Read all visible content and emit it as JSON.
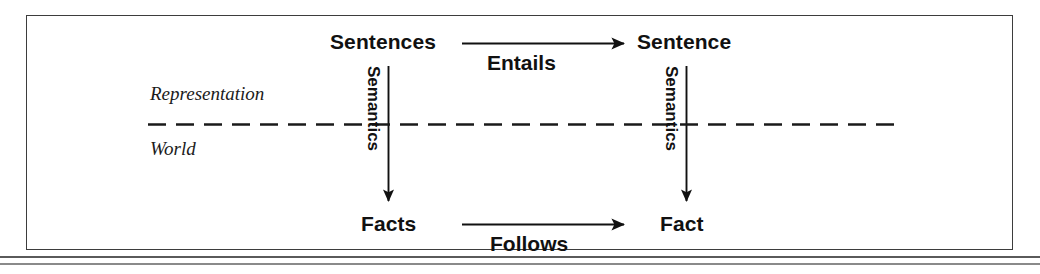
{
  "diagram": {
    "frame": {
      "border_color": "#3d3d3d"
    },
    "nodes": {
      "sentences": "Sentences",
      "sentence": "Sentence",
      "facts": "Facts",
      "fact": "Fact"
    },
    "edges": {
      "entails": "Entails",
      "follows": "Follows",
      "semantics_left": "Semantics",
      "semantics_right": "Semantics"
    },
    "regions": {
      "upper": "Representation",
      "lower": "World"
    },
    "divider": {
      "style": "dashed",
      "color": "#1a1a1a"
    },
    "colors": {
      "ink": "#111111",
      "rule": "#5a5a5a",
      "frame": "#3d3d3d"
    }
  }
}
